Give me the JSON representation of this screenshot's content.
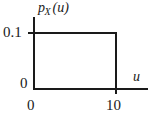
{
  "figure": {
    "axis_titles": {
      "y_symbol": "p",
      "y_subscript": "X",
      "y_argument": "(u)",
      "y_full": "pX(u)",
      "x": "u"
    },
    "tick_labels": {
      "y_high": "0.1",
      "y_zero": "0",
      "x_zero": "0",
      "x_ten": "10"
    },
    "colors": {
      "line": "#1a1a1a",
      "background": "#ffffff"
    }
  },
  "chart_data": {
    "type": "line",
    "title": "",
    "subtitle": "",
    "xlabel": "u",
    "ylabel": "pX(u)",
    "x": [
      0,
      0,
      10,
      10
    ],
    "y": [
      0,
      0.1,
      0.1,
      0
    ],
    "series": [
      {
        "name": "pX(u)",
        "x": [
          0,
          0,
          10,
          10
        ],
        "values": [
          0,
          0.1,
          0.1,
          0
        ]
      }
    ],
    "xlim": [
      0,
      13
    ],
    "ylim": [
      0,
      0.125
    ],
    "xticks": [
      0,
      10
    ],
    "xticklabels": [
      "0",
      "10"
    ],
    "yticks": [
      0,
      0.1
    ],
    "yticklabels": [
      "0",
      "0.1"
    ],
    "grid": false,
    "legend": false,
    "legend_position": "none"
  }
}
